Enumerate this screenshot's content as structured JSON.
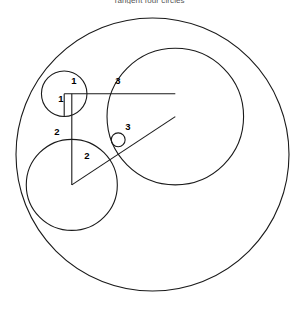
{
  "figure": {
    "title": "Tangent four circles",
    "background_color": "#ffffff",
    "stroke_color": "#1a1a1a",
    "label_color": "#000000",
    "width": 298,
    "height": 313
  },
  "chart_data": {
    "type": "diagram",
    "title": "Tangent four circles",
    "units": "radius units",
    "pixels_per_unit": 22.76,
    "xlabel": "",
    "ylabel": "",
    "grid": false,
    "legend": null,
    "circles": [
      {
        "name": "outer-enclosing-circle",
        "radius": 6,
        "center_x": 0,
        "center_y": 0,
        "px_center_x": 152.5,
        "px_center_y": 154.5,
        "px_radius": 136.5,
        "label": null,
        "filled": false
      },
      {
        "name": "circle-radius-1",
        "radius": 1,
        "center_x": -3.0,
        "center_y": 2.6667,
        "px_center_x": 64.2,
        "px_center_y": 93.8,
        "px_radius": 22.76,
        "label": "1",
        "filled": false
      },
      {
        "name": "circle-radius-2",
        "radius": 2,
        "center_x": -2.6667,
        "center_y": -1.3333,
        "px_center_x": 71.8,
        "px_center_y": 184.9,
        "px_radius": 45.52,
        "label": "2",
        "filled": false
      },
      {
        "name": "circle-radius-3",
        "radius": 3,
        "center_x": 1.0,
        "center_y": 1.6667,
        "px_center_x": 175.3,
        "px_center_y": 116.6,
        "px_radius": 68.28,
        "label": "3",
        "filled": false
      },
      {
        "name": "circle-small-gap",
        "radius": 0.3051,
        "center_x": -1.5085,
        "center_y": 0.6462,
        "px_center_x": 118.2,
        "px_center_y": 139.8,
        "px_radius": 6.94,
        "label": null,
        "filled": false
      }
    ],
    "radius_lines": [
      {
        "name": "radius-line-1-horizontal",
        "circle": "circle-radius-1",
        "from_x": -3.0,
        "from_y": 2.6667,
        "to_x": -2.0,
        "to_y": 2.6667,
        "label": "1"
      },
      {
        "name": "radius-line-1-vertical",
        "circle": "circle-radius-1",
        "from_x": -3.0,
        "from_y": 2.6667,
        "to_x": -3.0,
        "to_y": 1.6667,
        "label": "1"
      },
      {
        "name": "radius-line-2-vertical",
        "circle": "circle-radius-2",
        "from_x": -2.6667,
        "from_y": -1.3333,
        "to_x": -2.6667,
        "to_y": 0.6667,
        "label": "2"
      },
      {
        "name": "radius-line-2-diagonal",
        "circle": "circle-radius-2",
        "from_x": -2.6667,
        "from_y": -1.3333,
        "to_x": -0.8,
        "to_y": -0.6,
        "label": "2"
      },
      {
        "name": "radius-line-3-horizontal",
        "circle": "circle-radius-3",
        "from_x": 1.0,
        "from_y": 1.6667,
        "to_x": -2.0,
        "to_y": 1.6667,
        "label": "3"
      },
      {
        "name": "radius-line-3-diagonal",
        "circle": "circle-radius-3",
        "from_x": 1.0,
        "from_y": 1.6667,
        "to_x": -0.8,
        "to_y": -0.6,
        "label": "3"
      }
    ],
    "labels": [
      {
        "name": "label-1-top",
        "text": "1",
        "px_x": 74,
        "px_y": 84,
        "value": 1
      },
      {
        "name": "label-1-left",
        "text": "1",
        "px_x": 61,
        "px_y": 99,
        "value": 1
      },
      {
        "name": "label-3-top",
        "text": "3",
        "px_x": 118,
        "px_y": 84,
        "value": 3
      },
      {
        "name": "label-3-diagonal",
        "text": "3",
        "px_x": 128,
        "px_y": 127,
        "value": 3
      },
      {
        "name": "label-2-left",
        "text": "2",
        "px_x": 57,
        "px_y": 132,
        "value": 2
      },
      {
        "name": "label-2-bottom",
        "text": "2",
        "px_x": 87,
        "px_y": 156,
        "value": 2
      }
    ]
  }
}
